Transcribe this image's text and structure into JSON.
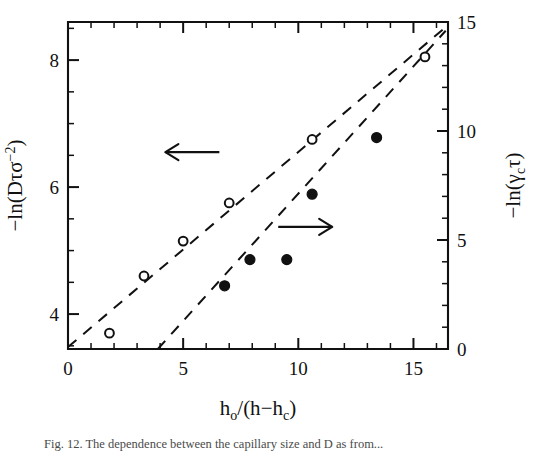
{
  "figure": {
    "caption": "Fig. 12. The dependence between the capillary size and D as from...",
    "background": "#ffffff",
    "ink_color": "#111111"
  },
  "chart_data": {
    "type": "scatter",
    "title": "",
    "xlabel": "h₀/(h−hᴄ)",
    "xlabel_parts": {
      "base1": "h",
      "sub1": "o",
      "slash": "/(h",
      "minus": "−",
      "base2": "h",
      "sub2": "c",
      "close": ")"
    },
    "ylabel_left": "−ln(Dτσ⁻²)",
    "ylabel_left_parts": {
      "prefix": "−ln(Dτσ",
      "sup": "−2",
      "suffix": ")"
    },
    "ylabel_right": "−ln(γᴄτ)",
    "ylabel_right_parts": {
      "prefix": "−ln(γ",
      "sub": "c",
      "suffix": "τ)"
    },
    "xlim": [
      0,
      16.5
    ],
    "ylim_left": [
      3.45,
      8.6
    ],
    "ylim_right": [
      0,
      15
    ],
    "xticks_major": [
      0,
      5,
      10,
      15
    ],
    "xticks_major_labels": [
      "0",
      "5",
      "10",
      "15"
    ],
    "xticks_minor_step": 1,
    "yticks_left_major": [
      4,
      6,
      8
    ],
    "yticks_left_major_labels": [
      "4",
      "6",
      "8"
    ],
    "yticks_left_minor_step": 0.5,
    "yticks_right_major": [
      0,
      5,
      10,
      15
    ],
    "yticks_right_major_labels": [
      "0",
      "5",
      "10",
      "15"
    ],
    "yticks_right_minor_step": 1,
    "grid": false,
    "legend": false,
    "series": [
      {
        "name": "open-circles",
        "marker": "open-circle",
        "axis": "left",
        "points": [
          {
            "x": 1.8,
            "y": 3.7
          },
          {
            "x": 3.3,
            "y": 4.6
          },
          {
            "x": 5.0,
            "y": 5.15
          },
          {
            "x": 7.0,
            "y": 5.75
          },
          {
            "x": 10.6,
            "y": 6.75
          },
          {
            "x": 15.5,
            "y": 8.05
          }
        ],
        "fit_line": {
          "x0": 0.0,
          "y0": 3.48,
          "x1": 16.4,
          "y1": 8.52,
          "style": "dashed"
        }
      },
      {
        "name": "filled-circles",
        "marker": "filled-circle",
        "axis": "right",
        "points": [
          {
            "x": 6.8,
            "y": 2.9
          },
          {
            "x": 7.9,
            "y": 4.1
          },
          {
            "x": 9.5,
            "y": 4.1
          },
          {
            "x": 10.6,
            "y": 7.1
          },
          {
            "x": 13.4,
            "y": 9.7
          }
        ],
        "fit_line": {
          "x0": 3.9,
          "y0": 0.0,
          "x1": 16.4,
          "y1": 14.6,
          "style": "dashed"
        }
      }
    ],
    "annotations": [
      {
        "name": "left-axis-arrow",
        "text": "←",
        "direction": "left",
        "x": 5.4,
        "y_left": 6.55
      },
      {
        "name": "right-axis-arrow",
        "text": "→",
        "direction": "right",
        "x": 10.3,
        "y_right": 5.6
      }
    ]
  }
}
